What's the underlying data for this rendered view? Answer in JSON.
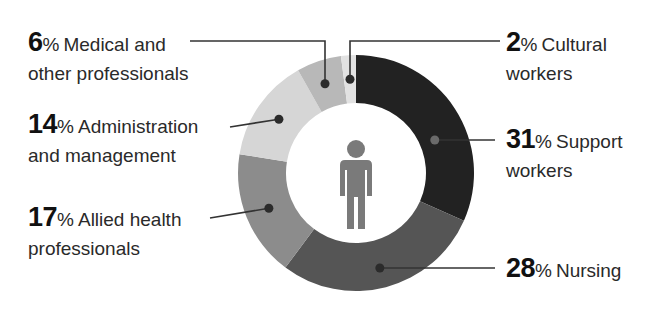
{
  "chart_data": {
    "type": "pie",
    "subtype": "donut",
    "title": "",
    "center_icon": "person-icon",
    "start_angle_deg": 0,
    "direction": "clockwise",
    "note": "Labelled values sum to 98% (as shown in source)",
    "slices": [
      {
        "key": "support",
        "value": 31,
        "pct_text": "31",
        "label_line1": "Support",
        "label_line2": "workers",
        "color": "#222222"
      },
      {
        "key": "nursing",
        "value": 28,
        "pct_text": "28",
        "label_line1": "Nursing",
        "label_line2": "",
        "color": "#555555"
      },
      {
        "key": "allied",
        "value": 17,
        "pct_text": "17",
        "label_line1": "Allied health",
        "label_line2": "professionals",
        "color": "#8c8c8c"
      },
      {
        "key": "admin",
        "value": 14,
        "pct_text": "14",
        "label_line1": "Administration",
        "label_line2": "and management",
        "color": "#d6d6d6"
      },
      {
        "key": "medical",
        "value": 6,
        "pct_text": "6",
        "label_line1": "Medical and",
        "label_line2": "other professionals",
        "color": "#b8b8b8"
      },
      {
        "key": "cultural",
        "value": 2,
        "pct_text": "2",
        "label_line1": "Cultural",
        "label_line2": "workers",
        "color": "#e2e2e2"
      }
    ],
    "percent_symbol": "%",
    "icon_color": "#7a7a7a",
    "leader_color": "#333333",
    "marker_color": "#2b2b2b"
  }
}
